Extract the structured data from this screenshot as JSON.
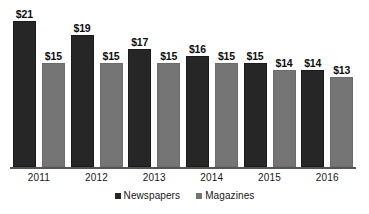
{
  "chart_data": {
    "type": "bar",
    "title": "",
    "subtitle": "",
    "xlabel": "",
    "ylabel": "",
    "categories": [
      "2011",
      "2012",
      "2013",
      "2014",
      "2015",
      "2016"
    ],
    "series": [
      {
        "name": "Newspapers",
        "color": "#262626",
        "values": [
          21,
          19,
          17,
          16,
          15,
          14
        ],
        "labels": [
          "$21",
          "$19",
          "$17",
          "$16",
          "$15",
          "$14"
        ]
      },
      {
        "name": "Magazines",
        "color": "#757575",
        "values": [
          15,
          15,
          15,
          15,
          14,
          13
        ],
        "labels": [
          "$15",
          "$15",
          "$15",
          "$15",
          "$14",
          "$13"
        ]
      }
    ],
    "ylim": [
      0,
      21
    ],
    "grid": false,
    "legend_position": "bottom",
    "value_labels_shown": true,
    "axis_line_color": "#555555"
  }
}
